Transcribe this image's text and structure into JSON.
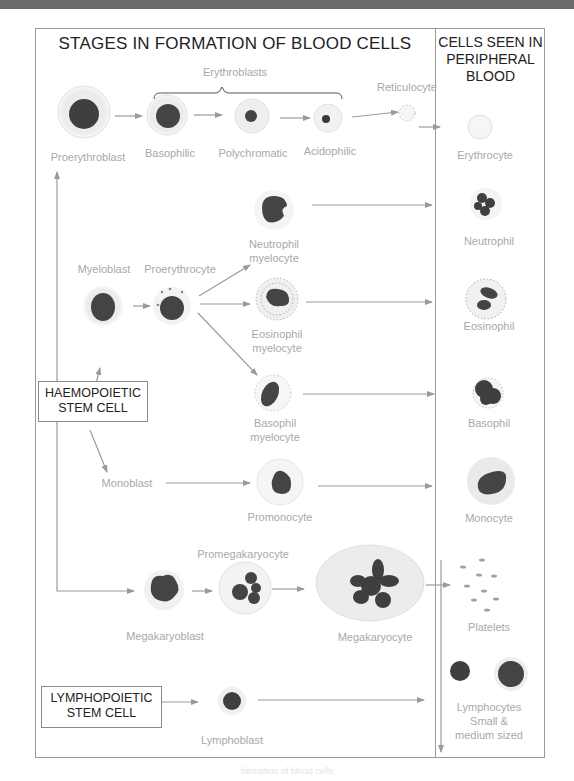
{
  "title": "STAGES IN FORMATION OF BLOOD CELLS",
  "peripheral_title": "CELLS SEEN IN PERIPHERAL BLOOD",
  "peripheral_title_lines": [
    "CELLS SEEN IN",
    "PERIPHERAL",
    "BLOOD"
  ],
  "stem_cells": {
    "haemopoietic": [
      "HAEMOPOIETIC",
      "STEM CELL"
    ],
    "lymphopoietic": [
      "LYMPHOPOIETIC",
      "STEM CELL"
    ]
  },
  "labels": {
    "erythroblasts": "Erythroblasts",
    "proerythroblast": "Proerythroblast",
    "basophilic": "Basophilic",
    "polychromatic": "Polychromatic",
    "acidophilic": "Acidophilic",
    "reticulocyte": "Reticulocyte",
    "erythrocyte": "Erythrocyte",
    "myeloblast": "Myeloblast",
    "proerythrocyte": "Proerythrocyte",
    "neutrophil_myelocyte": [
      "Neutrophil",
      "myelocyte"
    ],
    "eosinophil_myelocyte": [
      "Eosinophil",
      "myelocyte"
    ],
    "basophil_myelocyte": [
      "Basophil",
      "myelocyte"
    ],
    "neutrophil": "Neutrophil",
    "eosinophil": "Eosinophil",
    "basophil": "Basophil",
    "monoblast": "Monoblast",
    "promonocyte": "Promonocyte",
    "monocyte": "Monocyte",
    "promegakaryocyte": "Promegakaryocyte",
    "megakaryoblast": "Megakaryoblast",
    "megakaryocyte": "Megakaryocyte",
    "platelets": "Platelets",
    "lymphoblast": "Lymphoblast",
    "lymphocytes": [
      "Lymphocytes",
      "Small &",
      "medium sized"
    ]
  },
  "caption": "formation of blood cells",
  "colors": {
    "line": "#9a9a9a",
    "nucleus": "#3f3f3f",
    "cytoplasm": "#ececec",
    "label": "#a8a8a8",
    "banner": "#6a6a6a"
  }
}
